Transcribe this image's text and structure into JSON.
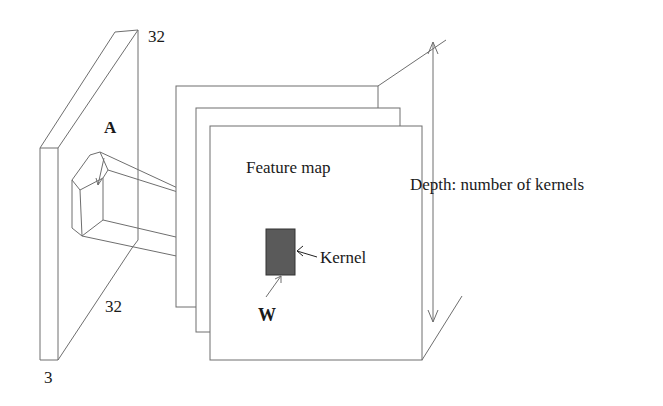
{
  "diagram": {
    "input_volume": {
      "height_label": "32",
      "width_label": "32",
      "depth_label": "3",
      "receptive_field_label": "A"
    },
    "feature_maps": {
      "label": "Feature map",
      "count_drawn": 3
    },
    "kernel": {
      "label": "Kernel",
      "weight_label": "W",
      "fill_color": "#5a5a5a"
    },
    "depth_annotation": {
      "label": "Depth: number of kernels"
    },
    "colors": {
      "line": "#6e6e6e",
      "text": "#1a1a1a",
      "background": "#ffffff"
    }
  }
}
